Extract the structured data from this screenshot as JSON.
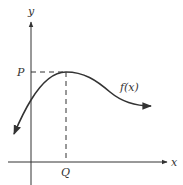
{
  "diagram": {
    "axes": {
      "x_label": "x",
      "y_label": "y"
    },
    "points": {
      "P_label": "P",
      "Q_label": "Q"
    },
    "curve": {
      "label": "f(x)",
      "description": "curve rising to a local maximum at (Q, P), then decreasing and leveling off"
    },
    "colors": {
      "stroke": "#333333",
      "background": "#ffffff"
    }
  }
}
